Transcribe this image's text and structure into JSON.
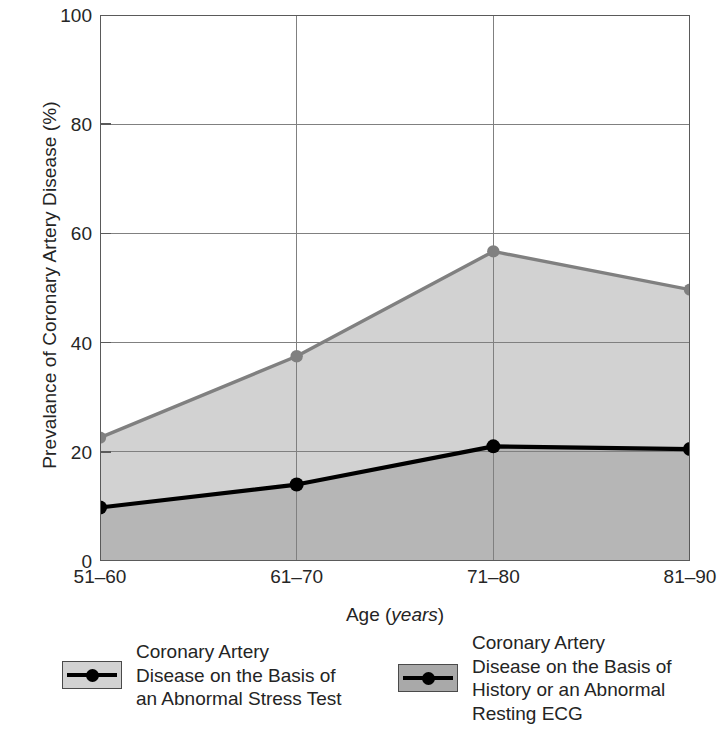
{
  "chart_data": {
    "type": "line",
    "title": "",
    "xlabel": "Age (years)",
    "xlabel_plain": "Age (",
    "xlabel_italic": "years",
    "xlabel_tail": ")",
    "ylabel": "Prevalance of Coronary Artery Disease (%)",
    "categories": [
      "51–60",
      "61–70",
      "71–80",
      "81–90"
    ],
    "yticks": [
      "0",
      "20",
      "40",
      "60",
      "80",
      "100"
    ],
    "ytick_values": [
      0,
      20,
      40,
      60,
      80,
      100
    ],
    "ylim": [
      0,
      100
    ],
    "grid": true,
    "legend_position": "below",
    "series": [
      {
        "name": "Coronary Artery Disease on the Basis of an Abnormal Stress Test",
        "name_lines": "Coronary Artery\nDisease on the Basis of\nan Abnormal Stress Test",
        "values": [
          22.6,
          37.5,
          56.7,
          49.7
        ],
        "line_color": "#808080",
        "marker_color": "#808080",
        "fill_color": "#d2d2d2",
        "swatch_fill": "#d2d2d2"
      },
      {
        "name": "Coronary Artery Disease on the Basis of History or an Abnormal Resting ECG",
        "name_lines": "Coronary Artery\nDisease on the Basis of\nHistory or an Abnormal\nResting ECG",
        "values": [
          9.8,
          14.0,
          21.0,
          20.5
        ],
        "line_color": "#000000",
        "marker_color": "#000000",
        "fill_color": "#b6b6b6",
        "swatch_fill": "#a9a9a9"
      }
    ],
    "axis_color": "#5a5a5a",
    "grid_color": "#808080"
  },
  "legend": {
    "entries": [
      {
        "label": "Coronary Artery\nDisease on the Basis of\nan Abnormal Stress Test"
      },
      {
        "label": "Coronary Artery\nDisease on the Basis of\nHistory or an Abnormal\nResting ECG"
      }
    ]
  }
}
